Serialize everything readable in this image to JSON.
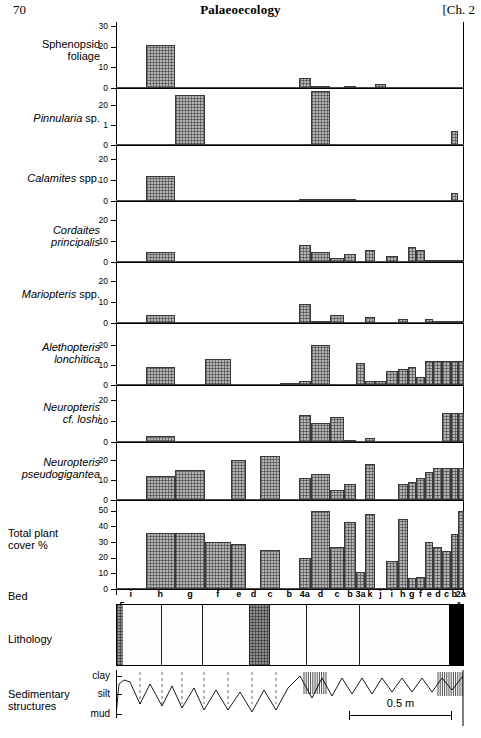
{
  "header": {
    "folio": "70",
    "running_title": "Palaeoecology",
    "chapter": "[Ch. 2"
  },
  "row_labels": {
    "sphenopsid": "Sphenopsid\nfoliage",
    "sphenopsid_l1": "Sphenopsid",
    "sphenopsid_l2": "foliage",
    "pinnularia_genus": "Pinnularia",
    "pinnularia_rank": "sp.",
    "calamites_genus": "Calamites",
    "calamites_rank": "spp.",
    "cordaites_l1": "Cordaites",
    "cordaites_l2": "principalis",
    "mariopteris_genus": "Mariopteris",
    "mariopteris_rank": "spp.",
    "alethopteris_l1": "Alethopteris",
    "alethopteris_l2": "lonchitica",
    "neuropteris_loshi_l1": "Neuropteris",
    "neuropteris_loshi_l2": "cf. loshi",
    "neuropteris_pseudo_l1": "Neuropteris",
    "neuropteris_pseudo_l2": "pseudogigantea",
    "total_cover_l1": "Total plant",
    "total_cover_l2": "cover %",
    "bed": "Bed",
    "lithology": "Lithology",
    "sed_l1": "Sedimentary",
    "sed_l2": "structures"
  },
  "sed_axis_labels": [
    "clay",
    "silt",
    "mud"
  ],
  "scale": {
    "label": "0.5 m"
  },
  "bed_labels": [
    "5",
    "i",
    "h",
    "g",
    "f",
    "e",
    "d",
    "c",
    "b",
    "4a",
    "d",
    "c",
    "b",
    "3a",
    "k",
    "j",
    "i",
    "h",
    "g",
    "f",
    "e",
    "d",
    "c",
    "b",
    "2a",
    "1"
  ],
  "chart_data": {
    "type": "bar",
    "title": "Palaeoecology",
    "xlabel": "Bed",
    "ylabel": "percentage cover",
    "grid": false,
    "legend": "none",
    "categories": [
      "i",
      "h",
      "g",
      "f",
      "e",
      "d",
      "c",
      "b",
      "4a",
      "d",
      "c",
      "b",
      "3a",
      "k",
      "j",
      "i",
      "h",
      "g",
      "f",
      "e",
      "d",
      "c",
      "b",
      "2a"
    ],
    "panels": [
      {
        "name": "Sphenopsid foliage",
        "ylim": [
          0,
          30
        ],
        "yticks": [
          0,
          10,
          20,
          30
        ],
        "values": [
          0,
          21,
          0,
          0,
          0,
          0,
          0,
          0,
          5,
          1,
          0,
          1,
          0,
          0,
          2,
          0,
          0,
          0,
          0,
          0,
          0,
          0,
          0,
          0
        ]
      },
      {
        "name": "Pinnularia sp.",
        "ylim": [
          0,
          28
        ],
        "yticks": [
          0,
          10,
          20
        ],
        "values": [
          0,
          0,
          25,
          0,
          0,
          0,
          0,
          0,
          0,
          27,
          0,
          0,
          0,
          0,
          0,
          0,
          0,
          0,
          0,
          0,
          0,
          0,
          7,
          0
        ]
      },
      {
        "name": "Calamites spp.",
        "ylim": [
          0,
          24
        ],
        "yticks": [
          0,
          10,
          20
        ],
        "values": [
          0,
          12,
          0,
          0,
          0,
          0,
          0,
          0,
          1,
          1,
          1,
          1,
          0,
          0,
          0,
          0,
          0,
          0,
          0,
          0,
          0,
          0,
          4,
          0
        ]
      },
      {
        "name": "Cordaites principalis",
        "ylim": [
          0,
          24
        ],
        "yticks": [
          0,
          10,
          20
        ],
        "values": [
          0,
          5,
          0,
          0,
          0,
          0,
          0,
          0,
          8,
          5,
          2,
          4,
          0,
          6,
          0,
          3,
          0,
          7,
          6,
          1,
          1,
          1,
          1,
          1
        ]
      },
      {
        "name": "Mariopteris spp.",
        "ylim": [
          0,
          24
        ],
        "yticks": [
          0,
          10,
          20
        ],
        "values": [
          0,
          4,
          0,
          0,
          0,
          0,
          0,
          0,
          9,
          1,
          4,
          0,
          0,
          3,
          0,
          0,
          2,
          0,
          0,
          2,
          1,
          1,
          1,
          1
        ]
      },
      {
        "name": "Alethopteris lonchitica",
        "ylim": [
          0,
          26
        ],
        "yticks": [
          0,
          10,
          20
        ],
        "values": [
          0,
          9,
          0,
          13,
          0,
          0,
          0,
          1,
          2,
          20,
          0,
          0,
          11,
          2,
          2,
          7,
          8,
          9,
          4,
          12,
          12,
          12,
          12,
          12
        ]
      },
      {
        "name": "Neuropteris cf. loshi",
        "ylim": [
          0,
          24
        ],
        "yticks": [
          0,
          10,
          20
        ],
        "values": [
          0,
          3,
          0,
          0,
          0,
          0,
          0,
          0,
          13,
          9,
          12,
          1,
          0,
          2,
          0,
          0,
          0,
          0,
          0,
          0,
          0,
          14,
          14,
          14
        ]
      },
      {
        "name": "Neuropteris pseudogigantea",
        "ylim": [
          0,
          26
        ],
        "yticks": [
          0,
          10,
          20
        ],
        "values": [
          0,
          12,
          15,
          0,
          20,
          0,
          22,
          0,
          11,
          13,
          5,
          8,
          0,
          18,
          0,
          0,
          8,
          9,
          11,
          14,
          16,
          16,
          16,
          16
        ]
      },
      {
        "name": "Total plant cover %",
        "ylim": [
          0,
          55
        ],
        "yticks": [
          0,
          10,
          20,
          30,
          40,
          50
        ],
        "values": [
          0,
          36,
          36,
          30,
          29,
          0,
          25,
          0,
          20,
          50,
          27,
          43,
          11,
          48,
          0,
          18,
          45,
          7,
          8,
          30,
          27,
          24,
          35,
          50
        ]
      }
    ]
  },
  "lithology": {
    "units": [
      {
        "type": "siltstone"
      },
      {
        "type": "sandstone"
      },
      {
        "type": "sandstone"
      },
      {
        "type": "sandstone"
      },
      {
        "type": "siltstone"
      },
      {
        "type": "sandstone"
      },
      {
        "type": "sandstone"
      },
      {
        "type": "sandstone"
      },
      {
        "type": "coal"
      }
    ]
  }
}
